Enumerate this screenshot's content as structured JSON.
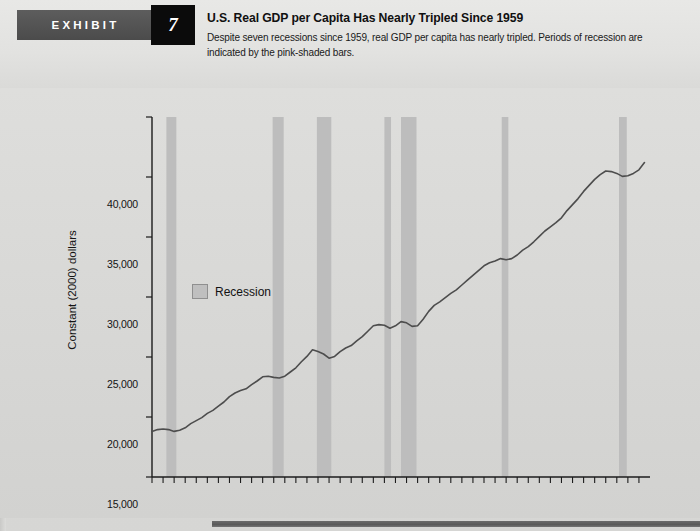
{
  "header": {
    "exhibit_label": "EXHIBIT",
    "exhibit_number": "7",
    "title": "U.S. Real GDP per Capita Has Nearly Tripled Since 1959",
    "subtitle": "Despite seven recessions since 1959, real GDP per capita has nearly tripled. Periods of recession are indicated by the pink-shaded bars."
  },
  "legend": {
    "recession_label": "Recession",
    "swatch_color": "#bfbfbf"
  },
  "chart_data": {
    "type": "line",
    "title": "U.S. Real GDP per Capita Has Nearly Tripled Since 1959",
    "xlabel": "",
    "ylabel": "Constant (2000) dollars",
    "ylim": [
      10000,
      40000
    ],
    "xlim": [
      1959,
      2004
    ],
    "ytick_values": [
      10000,
      15000,
      20000,
      25000,
      30000,
      35000,
      40000
    ],
    "ytick_labels": [
      "10,000",
      "15,000",
      "20,000",
      "25,000",
      "30,000",
      "35,000",
      "40,000"
    ],
    "xtick_labels": [
      "59",
      "61",
      "63",
      "65",
      "67",
      "69",
      "71",
      "73",
      "75",
      "77",
      "79",
      "81",
      "83",
      "85",
      "87",
      "89",
      "91",
      "93",
      "95",
      "97",
      "99",
      "01",
      "03"
    ],
    "xtick_years": [
      1959,
      1961,
      1963,
      1965,
      1967,
      1969,
      1971,
      1973,
      1975,
      1977,
      1979,
      1981,
      1983,
      1985,
      1987,
      1989,
      1991,
      1993,
      1995,
      1997,
      1999,
      2001,
      2003
    ],
    "grid": false,
    "legend_position": "inside-upper-left",
    "line_color": "#4d4d4d",
    "recession_band_color": "#bdbdbd",
    "series": [
      {
        "name": "Real GDP per capita (constant 2000 dollars)",
        "x": [
          1959,
          1959.5,
          1960,
          1960.5,
          1961,
          1961.5,
          1962,
          1962.5,
          1963,
          1963.5,
          1964,
          1964.5,
          1965,
          1965.5,
          1966,
          1966.5,
          1967,
          1967.5,
          1968,
          1968.5,
          1969,
          1969.5,
          1970,
          1970.5,
          1971,
          1971.5,
          1972,
          1972.5,
          1973,
          1973.5,
          1974,
          1974.5,
          1975,
          1975.5,
          1976,
          1976.5,
          1977,
          1977.5,
          1978,
          1978.5,
          1979,
          1979.5,
          1980,
          1980.5,
          1981,
          1981.5,
          1982,
          1982.5,
          1983,
          1983.5,
          1984,
          1984.5,
          1985,
          1985.5,
          1986,
          1986.5,
          1987,
          1987.5,
          1988,
          1988.5,
          1989,
          1989.5,
          1990,
          1990.5,
          1991,
          1991.5,
          1992,
          1992.5,
          1993,
          1993.5,
          1994,
          1994.5,
          1995,
          1995.5,
          1996,
          1996.5,
          1997,
          1997.5,
          1998,
          1998.5,
          1999,
          1999.5,
          2000,
          2000.5,
          2001,
          2001.5,
          2002,
          2002.5,
          2003,
          2003.5
        ],
        "values": [
          13800,
          13950,
          14000,
          13950,
          13800,
          13900,
          14100,
          14450,
          14700,
          14950,
          15300,
          15550,
          15900,
          16250,
          16700,
          17000,
          17200,
          17350,
          17700,
          18000,
          18350,
          18400,
          18300,
          18250,
          18400,
          18750,
          19100,
          19600,
          20050,
          20600,
          20450,
          20250,
          19900,
          20050,
          20450,
          20750,
          20950,
          21350,
          21700,
          22150,
          22600,
          22700,
          22650,
          22400,
          22600,
          22950,
          22850,
          22550,
          22600,
          23150,
          23800,
          24300,
          24600,
          24950,
          25300,
          25600,
          26000,
          26400,
          26800,
          27200,
          27600,
          27850,
          28000,
          28200,
          28100,
          28200,
          28500,
          28900,
          29200,
          29600,
          30050,
          30500,
          30850,
          31200,
          31600,
          32200,
          32700,
          33200,
          33800,
          34300,
          34800,
          35200,
          35500,
          35450,
          35300,
          35050,
          35100,
          35300,
          35600,
          36200
        ]
      }
    ],
    "recessions": [
      {
        "start": 1960.3,
        "end": 1961.2
      },
      {
        "start": 1969.9,
        "end": 1970.9
      },
      {
        "start": 1973.9,
        "end": 1975.2
      },
      {
        "start": 1980.0,
        "end": 1980.6
      },
      {
        "start": 1981.5,
        "end": 1982.9
      },
      {
        "start": 1990.6,
        "end": 1991.2
      },
      {
        "start": 2001.2,
        "end": 2001.9
      }
    ]
  }
}
